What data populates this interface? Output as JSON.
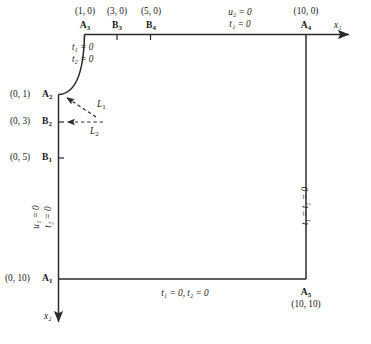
{
  "figure": {
    "type": "boundary-condition-domain-diagram",
    "axes": {
      "x_axis_label": "x₁",
      "y_axis_label": "x₂",
      "x_axis_name": "x1",
      "y_axis_name": "x2"
    },
    "domain": {
      "description": "Square region with a quarter-circle fillet at the top-left corner",
      "extent": [
        [
          0,
          0
        ],
        [
          10,
          10
        ]
      ]
    },
    "nodes": [
      {
        "id": "A3",
        "label": "A",
        "sub": "3",
        "coord": "(1, 0)",
        "edge": "top",
        "tick": true
      },
      {
        "id": "B3",
        "label": "B",
        "sub": "3",
        "coord": "(3, 0)",
        "edge": "top",
        "tick": true
      },
      {
        "id": "B4",
        "label": "B",
        "sub": "4",
        "coord": "(5, 0)",
        "edge": "top",
        "tick": true
      },
      {
        "id": "A4",
        "label": "A",
        "sub": "4",
        "coord": "(10, 0)",
        "edge": "top",
        "tick": false
      },
      {
        "id": "A2",
        "label": "A",
        "sub": "2",
        "coord": "(0, 1)",
        "edge": "left",
        "tick": false
      },
      {
        "id": "B2",
        "label": "B",
        "sub": "2",
        "coord": "(0, 3)",
        "edge": "left",
        "tick": true
      },
      {
        "id": "B1",
        "label": "B",
        "sub": "1",
        "coord": "(0, 5)",
        "edge": "left",
        "tick": true
      },
      {
        "id": "A1",
        "label": "A",
        "sub": "1",
        "coord": "(0, 10)",
        "edge": "left",
        "tick": false
      },
      {
        "id": "A5",
        "label": "A",
        "sub": "5",
        "coord": "(10, 10)",
        "edge": "bottom-right",
        "tick": false
      }
    ],
    "boundary_conditions": {
      "arc_top_left": {
        "line1": "t₁ = 0",
        "line2": "t₂ = 0"
      },
      "top_edge": {
        "line1": "u₂ = 0",
        "line2": "t₁ = 0"
      },
      "left_edge": {
        "line1": "u₁ = 0",
        "line2": "t₂ = 0"
      },
      "right_edge": {
        "text": "t₁ = t₂ = 0"
      },
      "bottom_edge": {
        "text": "t₁ = 0, t₂ = 0"
      }
    },
    "load_markers": [
      {
        "id": "L1",
        "label": "L",
        "sub": "1",
        "target_node": "A2",
        "style": "dashed-arrow-diagonal"
      },
      {
        "id": "L2",
        "label": "L",
        "sub": "2",
        "target_node": "B2",
        "style": "dashed-arrow-horizontal"
      }
    ],
    "colors": {
      "line": "#2b2b2f",
      "text": "#1a1a1a",
      "background": "#ffffff",
      "dashed": "#4a4a50"
    }
  }
}
